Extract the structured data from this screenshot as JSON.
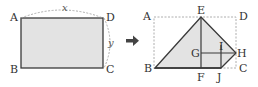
{
  "colors": {
    "fill": "#e3e3e3",
    "stroke": "#3a3a3a",
    "dashed": "#999999",
    "arrow": "#444444"
  },
  "left_figure": {
    "labels": {
      "A": "A",
      "B": "B",
      "C": "C",
      "D": "D"
    },
    "variables": {
      "width": "x",
      "height": "y"
    }
  },
  "arrow": {
    "icon": "right-arrow-icon"
  },
  "right_figure": {
    "labels": {
      "A": "A",
      "B": "B",
      "C": "C",
      "D": "D",
      "E": "E",
      "F": "F",
      "G": "G",
      "H": "H",
      "I": "I",
      "J": "J"
    }
  }
}
